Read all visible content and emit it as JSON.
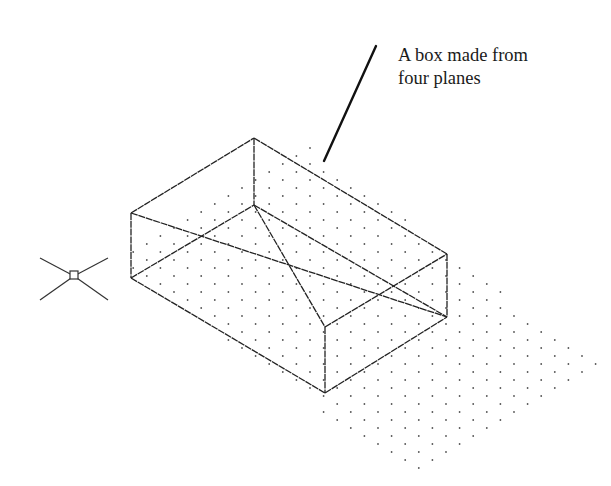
{
  "figure": {
    "type": "isometric-cad-drawing",
    "background": "#ffffff",
    "line_color": "#222222",
    "dot_color": "#555555"
  },
  "annotation": {
    "lines": [
      "A box made from",
      "four planes"
    ],
    "leader": {
      "x1": 376,
      "y1": 46,
      "x2": 324,
      "y2": 161,
      "width": 2.4
    }
  },
  "box": {
    "vertices": {
      "left_top": [
        131,
        213
      ],
      "left_bottom": [
        131,
        278
      ],
      "back_top": [
        254,
        138
      ],
      "back_bottom": [
        254,
        205
      ],
      "front_top": [
        325,
        327
      ],
      "front_bottom": [
        325,
        393
      ],
      "right_top": [
        447,
        254
      ],
      "right_bottom": [
        447,
        317
      ]
    },
    "edges": [
      [
        "left_top",
        "back_top"
      ],
      [
        "back_top",
        "right_top"
      ],
      [
        "left_top",
        "left_bottom"
      ],
      [
        "back_top",
        "back_bottom"
      ],
      [
        "right_top",
        "right_bottom"
      ],
      [
        "front_top",
        "front_bottom"
      ],
      [
        "left_top",
        "right_bottom"
      ],
      [
        "left_bottom",
        "back_bottom"
      ],
      [
        "back_bottom",
        "right_bottom"
      ],
      [
        "left_bottom",
        "front_bottom"
      ],
      [
        "front_bottom",
        "right_bottom"
      ],
      [
        "front_top",
        "right_top"
      ],
      [
        "back_bottom",
        "front_top"
      ]
    ],
    "stroke_width": 1.3
  },
  "dot_grid": {
    "style": "isometric",
    "col_pitch": 13.6,
    "row_pitch": 8,
    "region": {
      "top": [
        310,
        148
      ],
      "left": [
        117,
        258
      ],
      "bottom": [
        407,
        477
      ],
      "right": [
        600,
        367
      ]
    },
    "dot_radius": 0.9
  },
  "ucs_icon": {
    "label": "UCS icon",
    "center": [
      74,
      276
    ],
    "arms": [
      [
        40,
        258
      ],
      [
        108,
        258
      ],
      [
        40,
        300
      ],
      [
        108,
        300
      ]
    ],
    "box_size": 8
  }
}
